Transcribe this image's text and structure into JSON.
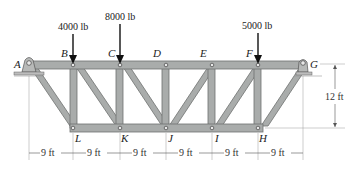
{
  "diagram": {
    "type": "truss",
    "joints": {
      "top": [
        "A",
        "B",
        "C",
        "D",
        "E",
        "F",
        "G"
      ],
      "bottom": [
        "L",
        "K",
        "J",
        "I",
        "H"
      ]
    },
    "labels": {
      "A": "A",
      "B": "B",
      "C": "C",
      "D": "D",
      "E": "E",
      "F": "F",
      "G": "G",
      "H": "H",
      "I": "I",
      "J": "J",
      "K": "K",
      "L": "L"
    },
    "loads": [
      {
        "joint": "B",
        "label": "4000 lb"
      },
      {
        "joint": "C",
        "label": "8000 lb"
      },
      {
        "joint": "F",
        "label": "5000 lb"
      }
    ],
    "dimensions": {
      "panels": [
        "9 ft",
        "9 ft",
        "9 ft",
        "9 ft",
        "9 ft",
        "9 ft"
      ],
      "height": "12 ft"
    },
    "supports": {
      "A": "pin",
      "G": "roller"
    },
    "members": [
      "AB",
      "BC",
      "CD",
      "DE",
      "EF",
      "FG",
      "LK",
      "KJ",
      "JI",
      "IH",
      "AL",
      "BL",
      "BK",
      "CK",
      "CJ",
      "DJ",
      "JE",
      "EI",
      "IF",
      "FH",
      "HG"
    ],
    "colors": {
      "member_fill": "#a9acab",
      "member_stroke": "#6e7170",
      "text": "#222222"
    }
  }
}
